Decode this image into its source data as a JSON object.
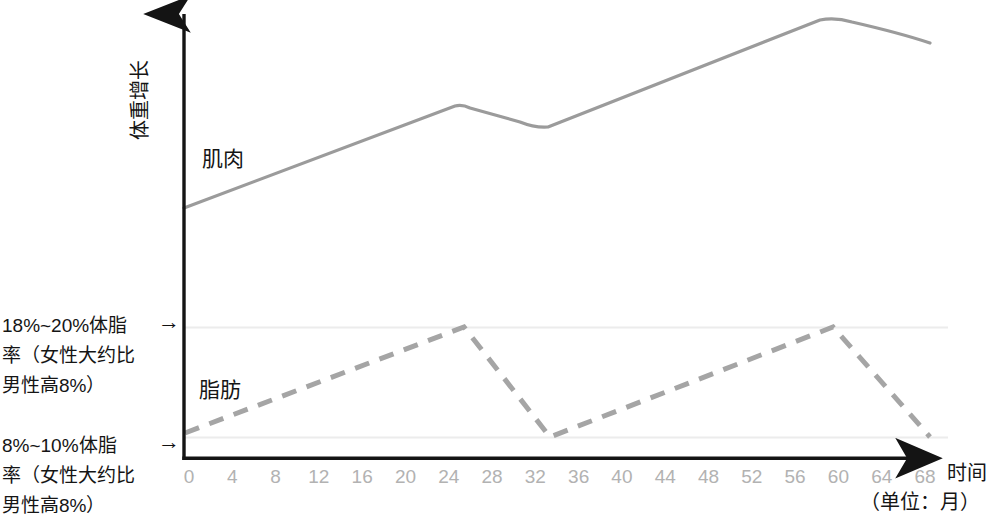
{
  "chart_data": {
    "type": "line",
    "title": "",
    "xlabel": "时间",
    "xunit": "（单位：月）",
    "ylabel": "体重增长",
    "xticks": [
      0,
      4,
      8,
      12,
      16,
      20,
      24,
      28,
      32,
      36,
      40,
      44,
      48,
      52,
      56,
      60,
      64,
      68
    ],
    "xlim": [
      0,
      68
    ],
    "ylim": [
      0,
      100
    ],
    "grid": "two faint horizontal reference lines at the 8%~10% and 18%~20% body-fat levels",
    "legend_position": "inline labels next to each curve",
    "series": [
      {
        "name": "肌肉",
        "style": "solid",
        "color": "#9b9b9b",
        "x": [
          0,
          26,
          34,
          60,
          69
        ],
        "values": [
          36,
          68,
          62,
          95,
          88
        ],
        "description": "稳步上升，第26月小高峰后短暂回落，第60月达到最高后略降"
      },
      {
        "name": "脂肪",
        "style": "dashed",
        "color": "#a5a5a5",
        "x": [
          0,
          26,
          34,
          60,
          69
        ],
        "values": [
          9,
          19,
          8,
          19,
          8
        ],
        "description": "在8%~10%与18%~20%体脂率之间周期性升降"
      }
    ],
    "reference_lines": [
      {
        "label": "18%~20%体脂率（女性大约比男性高8%）",
        "value": 19
      },
      {
        "label": "8%~10%体脂率（女性大约比男性高8%）",
        "value": 8
      }
    ]
  },
  "annotations": {
    "high": "18%~20%体脂\n率（女性大约比\n男性高8%）",
    "low": "8%~10%体脂\n率（女性大约比\n男性高8%）",
    "arrow": "→"
  },
  "series_labels": {
    "muscle": "肌肉",
    "fat": "脂肪"
  },
  "axes": {
    "y_title": "体重增长",
    "x_title": "时间",
    "x_unit": "（单位：月）"
  },
  "colors": {
    "muscle_line": "#9b9b9b",
    "fat_line": "#a5a5a5",
    "axis": "#141414",
    "tick_text": "#b2b2b2",
    "gridline": "#ebebeb",
    "body_text": "#151515"
  }
}
